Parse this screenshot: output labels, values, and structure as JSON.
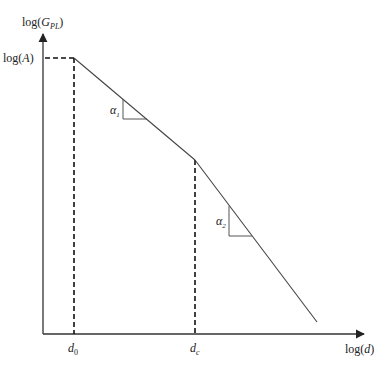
{
  "diagram": {
    "y_axis_label": "log(G_PL)",
    "y_axis_label_parts": {
      "pre": "log(",
      "var": "G",
      "sub": "PL",
      "post": ")"
    },
    "x_axis_label": "log(d)",
    "x_axis_label_parts": {
      "pre": "log(",
      "var": "d",
      "post": ")"
    },
    "y_tick_label": "log(A)",
    "y_tick_label_parts": {
      "pre": "log(",
      "var": "A",
      "post": ")"
    },
    "x_ticks": [
      {
        "label": "d0",
        "var": "d",
        "sub": "0"
      },
      {
        "label": "dc",
        "var": "d",
        "sub": "c"
      }
    ],
    "slopes": [
      {
        "label": "α1",
        "var": "α",
        "sub": "1"
      },
      {
        "label": "α2",
        "var": "α",
        "sub": "2"
      }
    ],
    "colors": {
      "solid_line": "#444444",
      "dashed_line": "#111111",
      "axis": "#333333"
    }
  }
}
